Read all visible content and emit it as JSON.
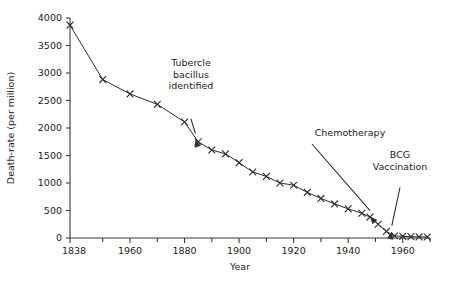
{
  "chart_data": {
    "type": "line",
    "title": "",
    "xlabel": "Year",
    "ylabel": "Death-rate (per million)",
    "xlim": [
      1838,
      1970
    ],
    "ylim": [
      0,
      4000
    ],
    "grid": false,
    "legend": null,
    "marker": "x",
    "x_tick_labels": [
      "1838",
      "1960",
      "1880",
      "1900",
      "1920",
      "1940",
      "1960"
    ],
    "x_tick_values": [
      1838,
      1860,
      1880,
      1900,
      1920,
      1940,
      1960
    ],
    "x_minor_ticks": [
      1850,
      1870,
      1890,
      1910,
      1930,
      1950,
      1970
    ],
    "y_tick_labels": [
      "0",
      "500",
      "1000",
      "1500",
      "2000",
      "2500",
      "3000",
      "3500",
      "4000"
    ],
    "y_tick_values": [
      0,
      500,
      1000,
      1500,
      2000,
      2500,
      3000,
      3500,
      4000
    ],
    "x": [
      1838,
      1850,
      1860,
      1870,
      1880,
      1885,
      1890,
      1895,
      1900,
      1905,
      1910,
      1915,
      1920,
      1925,
      1930,
      1935,
      1940,
      1945,
      1948,
      1951,
      1954,
      1957,
      1960,
      1963,
      1966,
      1969
    ],
    "values": [
      3870,
      2880,
      2620,
      2430,
      2110,
      1750,
      1600,
      1530,
      1370,
      1200,
      1120,
      1000,
      960,
      830,
      720,
      620,
      530,
      450,
      380,
      250,
      120,
      40,
      30,
      25,
      20,
      18
    ],
    "annotations": [
      {
        "name": "tubercle-bacillus",
        "lines": [
          "Tubercle",
          "bacillus",
          "identified"
        ],
        "text": "Tubercle bacillus identified",
        "arrow": "down",
        "target_x": 1884,
        "target_y": 1790
      },
      {
        "name": "chemotherapy",
        "lines": [
          "Chemotherapy"
        ],
        "text": "Chemotherapy",
        "arrow": "diagonal",
        "target_x": 1948,
        "target_y": 390
      },
      {
        "name": "bcg-vaccination",
        "lines": [
          "BCG",
          "Vaccination"
        ],
        "text": "BCG Vaccination",
        "arrow": "down",
        "target_x": 1956,
        "target_y": 115
      }
    ],
    "colors": {
      "line": "#2e2e2e",
      "axis": "#3a3a3a",
      "text": "#1c1c1c",
      "background": "#ffffff"
    }
  }
}
